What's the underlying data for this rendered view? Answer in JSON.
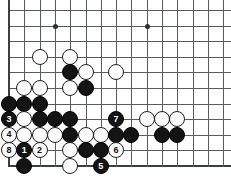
{
  "board": {
    "type": "go-board",
    "title": "Go game diagram",
    "geometry": {
      "origin_x": 9,
      "origin_y": 10,
      "col_spacing": 15.3,
      "row_spacing": 15.6,
      "cols": 15,
      "rows": 11,
      "stone_diameter": 16,
      "visible_edges": [
        "left",
        "bottom"
      ]
    },
    "star_points": [
      {
        "col": 3,
        "row": 1
      },
      {
        "col": 9,
        "row": 1
      }
    ],
    "stones": [
      {
        "col": 2,
        "row": 3,
        "color": "white",
        "label": ""
      },
      {
        "col": 4,
        "row": 3,
        "color": "white",
        "label": ""
      },
      {
        "col": 4,
        "row": 4,
        "color": "black",
        "label": ""
      },
      {
        "col": 5,
        "row": 4,
        "color": "white",
        "label": ""
      },
      {
        "col": 7,
        "row": 4,
        "color": "white",
        "label": ""
      },
      {
        "col": 1,
        "row": 5,
        "color": "white",
        "label": ""
      },
      {
        "col": 2,
        "row": 5,
        "color": "white",
        "label": ""
      },
      {
        "col": 4,
        "row": 5,
        "color": "white",
        "label": ""
      },
      {
        "col": 5,
        "row": 5,
        "color": "black",
        "label": ""
      },
      {
        "col": 0,
        "row": 6,
        "color": "black",
        "label": ""
      },
      {
        "col": 1,
        "row": 6,
        "color": "black",
        "label": ""
      },
      {
        "col": 2,
        "row": 6,
        "color": "black",
        "label": ""
      },
      {
        "col": 0,
        "row": 7,
        "color": "black",
        "label": "3"
      },
      {
        "col": 1,
        "row": 7,
        "color": "white",
        "label": ""
      },
      {
        "col": 2,
        "row": 7,
        "color": "black",
        "label": ""
      },
      {
        "col": 3,
        "row": 7,
        "color": "black",
        "label": ""
      },
      {
        "col": 4,
        "row": 7,
        "color": "black",
        "label": ""
      },
      {
        "col": 7,
        "row": 7,
        "color": "black",
        "label": "7"
      },
      {
        "col": 9,
        "row": 7,
        "color": "white",
        "label": ""
      },
      {
        "col": 10,
        "row": 7,
        "color": "white",
        "label": ""
      },
      {
        "col": 11,
        "row": 7,
        "color": "white",
        "label": ""
      },
      {
        "col": 0,
        "row": 8,
        "color": "white",
        "label": "4"
      },
      {
        "col": 1,
        "row": 8,
        "color": "white",
        "label": ""
      },
      {
        "col": 2,
        "row": 8,
        "color": "white",
        "label": ""
      },
      {
        "col": 3,
        "row": 8,
        "color": "white",
        "label": ""
      },
      {
        "col": 4,
        "row": 8,
        "color": "black",
        "label": ""
      },
      {
        "col": 5,
        "row": 8,
        "color": "white",
        "label": ""
      },
      {
        "col": 6,
        "row": 8,
        "color": "white",
        "label": ""
      },
      {
        "col": 7,
        "row": 8,
        "color": "black",
        "label": ""
      },
      {
        "col": 8,
        "row": 8,
        "color": "black",
        "label": ""
      },
      {
        "col": 10,
        "row": 8,
        "color": "black",
        "label": ""
      },
      {
        "col": 11,
        "row": 8,
        "color": "black",
        "label": ""
      },
      {
        "col": 0,
        "row": 9,
        "color": "white",
        "label": "8"
      },
      {
        "col": 1,
        "row": 9,
        "color": "black",
        "label": "1"
      },
      {
        "col": 2,
        "row": 9,
        "color": "white",
        "label": "2"
      },
      {
        "col": 4,
        "row": 9,
        "color": "white",
        "label": ""
      },
      {
        "col": 5,
        "row": 9,
        "color": "black",
        "label": ""
      },
      {
        "col": 6,
        "row": 9,
        "color": "black",
        "label": ""
      },
      {
        "col": 7,
        "row": 9,
        "color": "white",
        "label": "6"
      },
      {
        "col": 1,
        "row": 10,
        "color": "black",
        "label": ""
      },
      {
        "col": 4,
        "row": 10,
        "color": "white",
        "label": ""
      },
      {
        "col": 6,
        "row": 10,
        "color": "black",
        "label": "5"
      }
    ],
    "move_numbers": [
      "1",
      "2",
      "3",
      "4",
      "5",
      "6",
      "7",
      "8"
    ],
    "colors": {
      "black_stone": "#141414",
      "white_stone": "#fdfdfd",
      "stone_outline": "#1d1d1d",
      "grid_line": "#555b5e",
      "edge_line": "#3a3f42",
      "background": "#ffffff",
      "black_label_text": "#ffffff",
      "white_label_text": "#111111"
    }
  }
}
